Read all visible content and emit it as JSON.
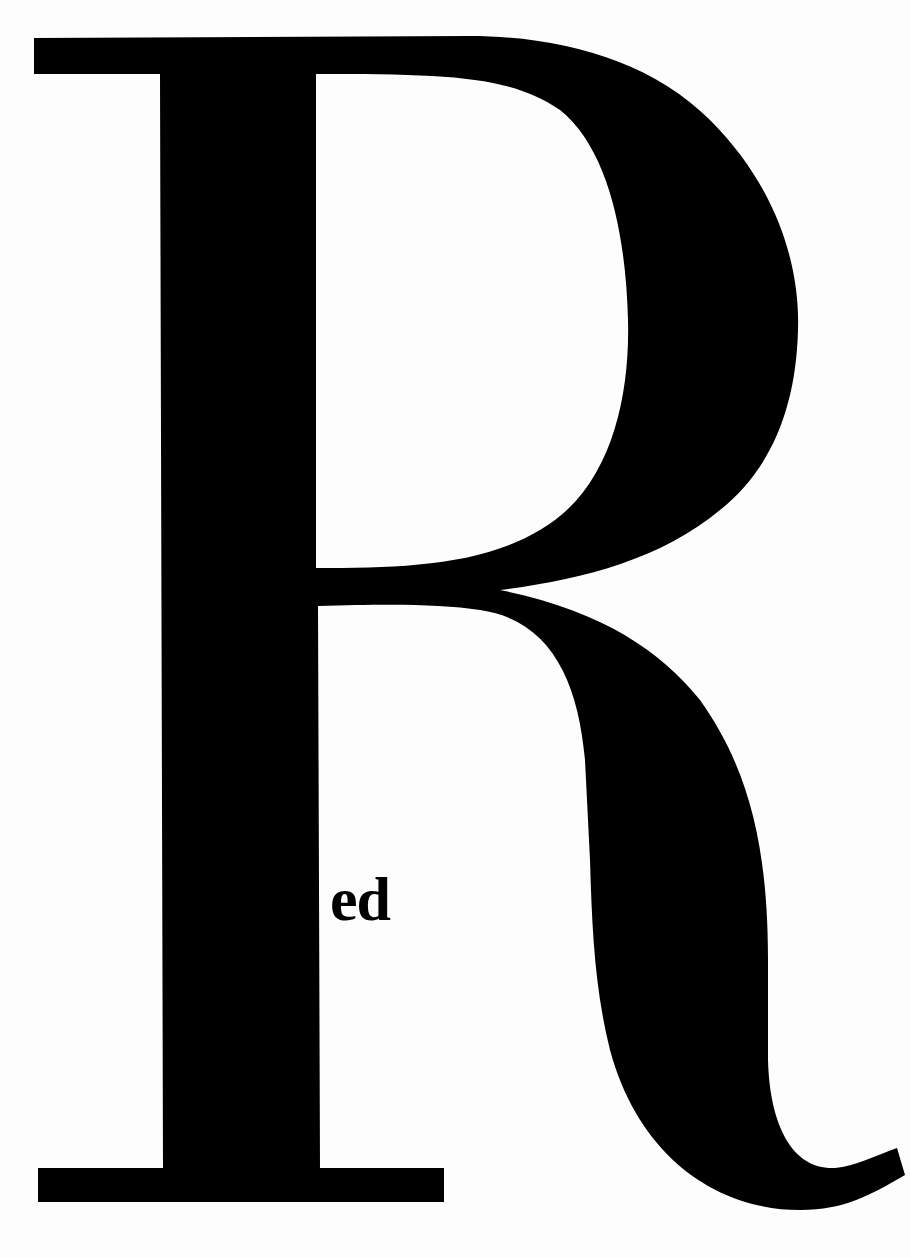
{
  "poster": {
    "big_letter": "R",
    "suffix_text": "ed",
    "word": "Red",
    "colors": {
      "background": "#fdfdfd",
      "ink": "#000000"
    }
  }
}
